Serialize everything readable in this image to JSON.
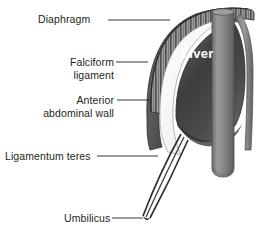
{
  "figure": {
    "type": "anatomical-diagram"
  },
  "labels": {
    "diaphragm": "Diaphragm",
    "falciform_line1": "Falciform",
    "falciform_line2": "ligament",
    "anterior_line1": "Anterior",
    "anterior_line2": "abdominal wall",
    "ligamentum_teres": "Ligamentum teres",
    "umbilicus": "Umbilicus",
    "liver": "Liver"
  },
  "colors": {
    "background": "#ffffff",
    "text": "#231f20",
    "liver_dark": "#3a3a3a",
    "liver_mid": "#6b6b6b",
    "organ_outline": "#4a4a4a",
    "diaphragm_band": "#8c8c8c",
    "cylinder": "#808080",
    "leader_line": "#231f20",
    "liver_label": "#ffffff"
  },
  "parts": [
    {
      "name": "diaphragm",
      "description": "striated muscular dome arching over the liver"
    },
    {
      "name": "falciform-ligament",
      "description": "pale sickle-shaped fold anterior to the liver"
    },
    {
      "name": "anterior-abdominal-wall",
      "description": "outer dark rim of the body wall"
    },
    {
      "name": "ligamentum-teres",
      "description": "paired cord running inferiorly to the umbilicus"
    },
    {
      "name": "umbilicus",
      "description": "inferior termination point of the ligamentum teres"
    },
    {
      "name": "liver",
      "description": "large dark shaded organ mass"
    },
    {
      "name": "vertical-cylinder",
      "description": "upright tubular structure to the right of the liver"
    }
  ]
}
